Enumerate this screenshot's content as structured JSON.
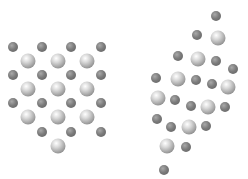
{
  "figure": {
    "colors": {
      "small_atom": "#7c7c7c",
      "large_atom": "#d8d8d8",
      "background": "#ffffff"
    },
    "panels": [
      {
        "name": "ordered-lattice",
        "atoms": [
          {
            "x": 13,
            "y": 47,
            "type": "small"
          },
          {
            "x": 42,
            "y": 47,
            "type": "small"
          },
          {
            "x": 71,
            "y": 47,
            "type": "small"
          },
          {
            "x": 101,
            "y": 47,
            "type": "small"
          },
          {
            "x": 28,
            "y": 61,
            "type": "large"
          },
          {
            "x": 58,
            "y": 61,
            "type": "large"
          },
          {
            "x": 87,
            "y": 61,
            "type": "large"
          },
          {
            "x": 13,
            "y": 75,
            "type": "small"
          },
          {
            "x": 42,
            "y": 75,
            "type": "small"
          },
          {
            "x": 71,
            "y": 75,
            "type": "small"
          },
          {
            "x": 101,
            "y": 75,
            "type": "small"
          },
          {
            "x": 28,
            "y": 89,
            "type": "large"
          },
          {
            "x": 58,
            "y": 89,
            "type": "large"
          },
          {
            "x": 87,
            "y": 89,
            "type": "large"
          },
          {
            "x": 13,
            "y": 103,
            "type": "small"
          },
          {
            "x": 42,
            "y": 103,
            "type": "small"
          },
          {
            "x": 71,
            "y": 103,
            "type": "small"
          },
          {
            "x": 101,
            "y": 103,
            "type": "small"
          },
          {
            "x": 28,
            "y": 117,
            "type": "large"
          },
          {
            "x": 58,
            "y": 117,
            "type": "large"
          },
          {
            "x": 87,
            "y": 117,
            "type": "large"
          },
          {
            "x": 42,
            "y": 132,
            "type": "small"
          },
          {
            "x": 71,
            "y": 132,
            "type": "small"
          },
          {
            "x": 101,
            "y": 132,
            "type": "small"
          },
          {
            "x": 58,
            "y": 146,
            "type": "large"
          }
        ]
      },
      {
        "name": "disordered-cluster",
        "atoms": [
          {
            "x": 216,
            "y": 16,
            "type": "small"
          },
          {
            "x": 197,
            "y": 35,
            "type": "small"
          },
          {
            "x": 218,
            "y": 38,
            "type": "large"
          },
          {
            "x": 178,
            "y": 56,
            "type": "small"
          },
          {
            "x": 198,
            "y": 59,
            "type": "large"
          },
          {
            "x": 216,
            "y": 61,
            "type": "small"
          },
          {
            "x": 233,
            "y": 69,
            "type": "small"
          },
          {
            "x": 156,
            "y": 78,
            "type": "small"
          },
          {
            "x": 178,
            "y": 79,
            "type": "large"
          },
          {
            "x": 196,
            "y": 80,
            "type": "small"
          },
          {
            "x": 212,
            "y": 84,
            "type": "small"
          },
          {
            "x": 228,
            "y": 87,
            "type": "large"
          },
          {
            "x": 158,
            "y": 98,
            "type": "large"
          },
          {
            "x": 175,
            "y": 100,
            "type": "small"
          },
          {
            "x": 191,
            "y": 106,
            "type": "small"
          },
          {
            "x": 208,
            "y": 107,
            "type": "large"
          },
          {
            "x": 225,
            "y": 107,
            "type": "small"
          },
          {
            "x": 157,
            "y": 119,
            "type": "small"
          },
          {
            "x": 171,
            "y": 127,
            "type": "small"
          },
          {
            "x": 189,
            "y": 127,
            "type": "large"
          },
          {
            "x": 206,
            "y": 126,
            "type": "small"
          },
          {
            "x": 167,
            "y": 146,
            "type": "large"
          },
          {
            "x": 186,
            "y": 147,
            "type": "small"
          },
          {
            "x": 164,
            "y": 170,
            "type": "small"
          }
        ]
      }
    ]
  }
}
